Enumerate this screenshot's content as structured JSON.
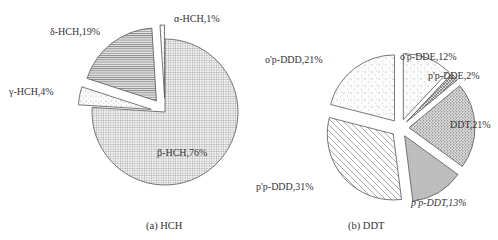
{
  "chart_data": [
    {
      "type": "pie",
      "title": "(a) HCH",
      "slices": [
        {
          "name": "β-HCH",
          "label": "β-HCH,76%",
          "value": 76,
          "pattern": "grid",
          "exploded": false
        },
        {
          "name": "γ-HCH",
          "label": "γ-HCH,4%",
          "value": 4,
          "pattern": "dots",
          "exploded": true
        },
        {
          "name": "δ-HCH",
          "label": "δ-HCH,19%",
          "value": 19,
          "pattern": "hlines",
          "exploded": true
        },
        {
          "name": "α-HCH",
          "label": "α-HCH,1%",
          "value": 1,
          "pattern": "dots",
          "exploded": true
        }
      ]
    },
    {
      "type": "pie",
      "title": "(b) DDT",
      "slices": [
        {
          "name": "o'p-DDE",
          "label": "o'p-DDE,12%",
          "value": 12,
          "pattern": "sparse-dots"
        },
        {
          "name": "p'p-DDE",
          "label": "p'p-DDE,2%",
          "value": 2,
          "pattern": "crosshatch"
        },
        {
          "name": "DDT",
          "label": "DDT,21%",
          "value": 21,
          "pattern": "dense-dots"
        },
        {
          "name": "p'p-DDT",
          "label": "p'p-DDT,13%",
          "value": 13,
          "pattern": "grey-grid"
        },
        {
          "name": "p'p-DDD",
          "label": "p'p-DDD,31%",
          "value": 31,
          "pattern": "diagonal"
        },
        {
          "name": "o'p-DDD",
          "label": "o'p-DDD,21%",
          "value": 21,
          "pattern": "sparse-dots"
        }
      ]
    }
  ]
}
